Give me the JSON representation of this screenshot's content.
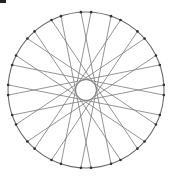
{
  "diagram": {
    "type": "circular string-art chord diagram",
    "center": [
      86,
      90
    ],
    "outer_radius": 78,
    "inner_clear_radius": 11,
    "point_count": 32,
    "pair_spacing_deg": 22.5,
    "pair_offset_deg": 3.75,
    "chord_span_deg": 165,
    "chord_count": 16,
    "colors": {
      "circle_stroke": "#6e6e6e",
      "chord_stroke": "#7a7a7a",
      "point_fill": "#333333",
      "background": "#ffffff"
    }
  }
}
